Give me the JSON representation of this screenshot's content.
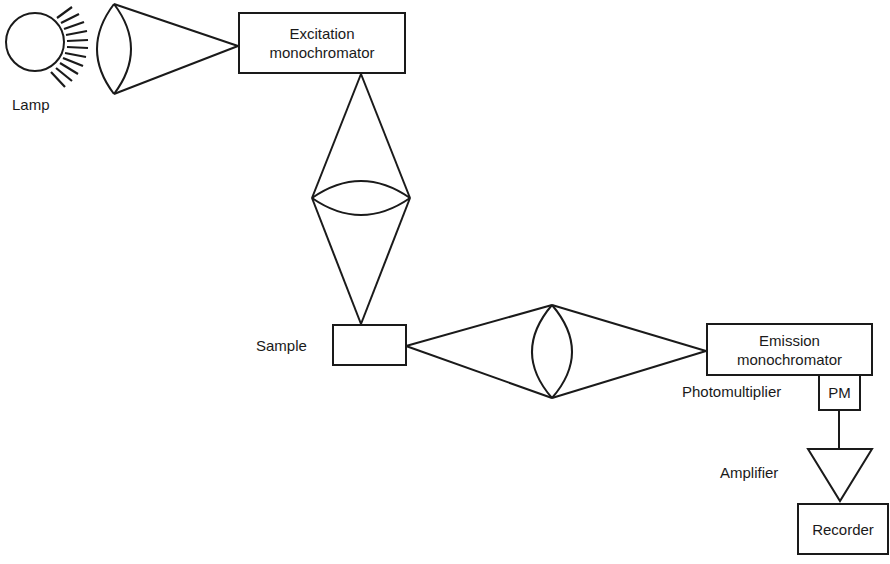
{
  "diagram": {
    "components": {
      "lamp": {
        "label": "Lamp"
      },
      "excitation_monochromator": {
        "line1": "Excitation",
        "line2": "monochromator"
      },
      "sample": {
        "label": "Sample"
      },
      "emission_monochromator": {
        "line1": "Emission",
        "line2": "monochromator"
      },
      "photomultiplier": {
        "label": "Photomultiplier",
        "box_label": "PM"
      },
      "amplifier": {
        "label": "Amplifier"
      },
      "recorder": {
        "label": "Recorder"
      }
    },
    "flow": [
      "Lamp",
      "Lens",
      "Excitation monochromator",
      "Lens",
      "Sample",
      "Lens",
      "Emission monochromator",
      "Photomultiplier",
      "Amplifier",
      "Recorder"
    ],
    "stroke_color": "#1a1a1a"
  }
}
